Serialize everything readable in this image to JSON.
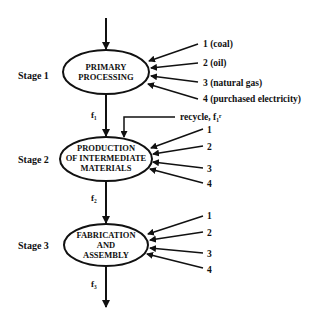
{
  "diagram": {
    "stages": [
      {
        "label": "Stage 1",
        "node_lines": [
          "PRIMARY",
          "PROCESSING"
        ],
        "inputs": [
          "1  (coal)",
          "2  (oil)",
          "3  (natural gas)",
          "4  (purchased electricity)"
        ],
        "output": "f₁"
      },
      {
        "label": "Stage 2",
        "node_lines": [
          "PRODUCTION",
          "OF INTERMEDIATE",
          "MATERIALS"
        ],
        "inputs": [
          "1",
          "2",
          "3",
          "4"
        ],
        "output": "f₂",
        "recycle": "recycle, f₁ʳ"
      },
      {
        "label": "Stage 3",
        "node_lines": [
          "FABRICATION",
          "AND",
          "ASSEMBLY"
        ],
        "inputs": [
          "1",
          "2",
          "3",
          "4"
        ],
        "output": "f₃"
      }
    ],
    "colors": {
      "stroke": "#111111",
      "background": "#ffffff"
    }
  }
}
